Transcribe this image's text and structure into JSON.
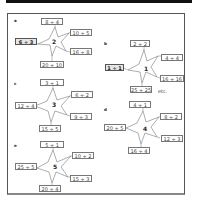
{
  "panels": [
    {
      "label": "a",
      "center": "2",
      "top": "8 ÷ 4",
      "upper_right": "10 ÷ 5",
      "left": "6 ÷ 3",
      "left_given": true,
      "lower_right": "16 ÷ 8",
      "bottom": "20 ÷ 10"
    },
    {
      "label": "b",
      "center": "1",
      "top": "2 ÷ 2",
      "upper_right": "4 ÷ 4",
      "left": "1 ÷ 1",
      "left_given": true,
      "lower_right": "16 ÷ 16",
      "bottom": "25 ÷ 25",
      "note": "etc."
    },
    {
      "label": "c",
      "center": "3",
      "top": "3 ÷ 1",
      "upper_right": "6 ÷ 2",
      "left": "12 ÷ 4",
      "lower_right": "9 ÷ 3",
      "bottom": "15 ÷ 5"
    },
    {
      "label": "d",
      "center": "4",
      "top": "4 ÷ 1",
      "upper_right": "8 ÷ 2",
      "left": "20 ÷ 5",
      "lower_right": "12 ÷ 3",
      "bottom": "16 ÷ 4"
    },
    {
      "label": "e",
      "center": "5",
      "top": "5 ÷ 1",
      "upper_right": "10 ÷ 2",
      "left": "25 ÷ 5",
      "lower_right": "15 ÷ 3",
      "bottom": "20 ÷ 4"
    }
  ]
}
